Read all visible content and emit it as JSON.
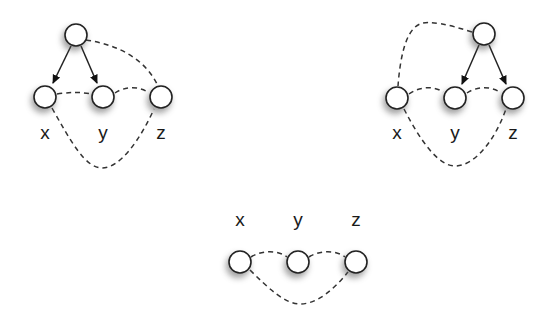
{
  "figure": {
    "type": "causal graph diagrams",
    "diagrams": [
      {
        "id": "left",
        "nodes": [
          {
            "id": "top",
            "label": ""
          },
          {
            "id": "x",
            "label": "x"
          },
          {
            "id": "y",
            "label": "y"
          },
          {
            "id": "z",
            "label": "z"
          }
        ],
        "directed_edges": [
          [
            "top",
            "x"
          ],
          [
            "top",
            "y"
          ]
        ],
        "bidirected_dashed_edges": [
          [
            "x",
            "y"
          ],
          [
            "y",
            "z"
          ],
          [
            "top",
            "z"
          ],
          [
            "x",
            "z"
          ]
        ]
      },
      {
        "id": "right",
        "nodes": [
          {
            "id": "top",
            "label": ""
          },
          {
            "id": "x",
            "label": "x"
          },
          {
            "id": "y",
            "label": "y"
          },
          {
            "id": "z",
            "label": "z"
          }
        ],
        "directed_edges": [
          [
            "top",
            "y"
          ],
          [
            "top",
            "z"
          ]
        ],
        "bidirected_dashed_edges": [
          [
            "x",
            "y"
          ],
          [
            "y",
            "z"
          ],
          [
            "top",
            "x"
          ],
          [
            "x",
            "z"
          ]
        ]
      },
      {
        "id": "bottom",
        "nodes": [
          {
            "id": "x",
            "label": "x"
          },
          {
            "id": "y",
            "label": "y"
          },
          {
            "id": "z",
            "label": "z"
          }
        ],
        "directed_edges": [],
        "bidirected_dashed_edges": [
          [
            "x",
            "y"
          ],
          [
            "y",
            "z"
          ],
          [
            "x",
            "z"
          ]
        ]
      }
    ]
  },
  "labels": {
    "left": {
      "x": "x",
      "y": "y",
      "z": "z"
    },
    "right": {
      "x": "x",
      "y": "y",
      "z": "z"
    },
    "bottom": {
      "x": "x",
      "y": "y",
      "z": "z"
    }
  },
  "colors": {
    "node_fill": "#ffffff",
    "node_stroke": "#222222",
    "edge": "#333333",
    "background": "#ffffff"
  }
}
